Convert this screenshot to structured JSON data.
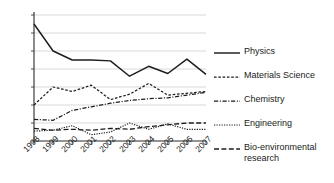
{
  "chart_data": {
    "type": "line",
    "title": "",
    "subtitle": "",
    "xlabel": "",
    "ylabel": "",
    "x": [
      "1998",
      "1999",
      "2000",
      "2001",
      "2002",
      "2003",
      "2004",
      "2005",
      "2006",
      "2007"
    ],
    "categories": [
      "1998",
      "1999",
      "2000",
      "2001",
      "2002",
      "2003",
      "2004",
      "2005",
      "2006",
      "2007"
    ],
    "xtick_labels": [
      "1998",
      "1999",
      "2000",
      "2001",
      "2002",
      "2003",
      "2004",
      "2005",
      "2006",
      "2007"
    ],
    "ytick_labels": [
      "70%",
      "60%",
      "50%",
      "40%",
      "30%",
      "20%",
      "10%",
      "0%"
    ],
    "ytick_values": [
      70,
      60,
      50,
      40,
      30,
      20,
      10,
      0
    ],
    "ylim": [
      0,
      70
    ],
    "yunit": "%",
    "grid": "horizontal",
    "legend_position": "right",
    "series": [
      {
        "name": "Physics",
        "line_style": "solid",
        "color": "#1c1c1c",
        "values": [
          65,
          50,
          45,
          45,
          44.5,
          36,
          41.5,
          37.5,
          45.5,
          37
        ]
      },
      {
        "name": "Materials Science",
        "line_style": "dotted",
        "color": "#1c1c1c",
        "values": [
          20,
          30,
          27.5,
          31,
          23,
          26,
          32,
          25.5,
          26.5,
          27.5
        ]
      },
      {
        "name": "Chemistry",
        "line_style": "dash-dot",
        "color": "#1c1c1c",
        "values": [
          12,
          11.5,
          17,
          19,
          21,
          22.5,
          23.5,
          24,
          25.5,
          27
        ]
      },
      {
        "name": "Engineering",
        "line_style": "fine-dotted",
        "color": "#1c1c1c",
        "values": [
          5.5,
          6,
          8.5,
          3.5,
          5,
          10,
          6.5,
          9.5,
          6.5,
          6.5
        ]
      },
      {
        "name": "Bio-environmental research",
        "line_style": "dashed",
        "color": "#1c1c1c",
        "values": [
          7,
          6,
          6.5,
          6,
          7,
          6.5,
          8,
          9,
          10,
          10
        ]
      }
    ]
  },
  "legend": {
    "items": [
      {
        "label": "Physics"
      },
      {
        "label": "Materials Science"
      },
      {
        "label": "Chemistry"
      },
      {
        "label": "Engineering"
      },
      {
        "label": "Bio-environmental\nresearch"
      }
    ]
  }
}
